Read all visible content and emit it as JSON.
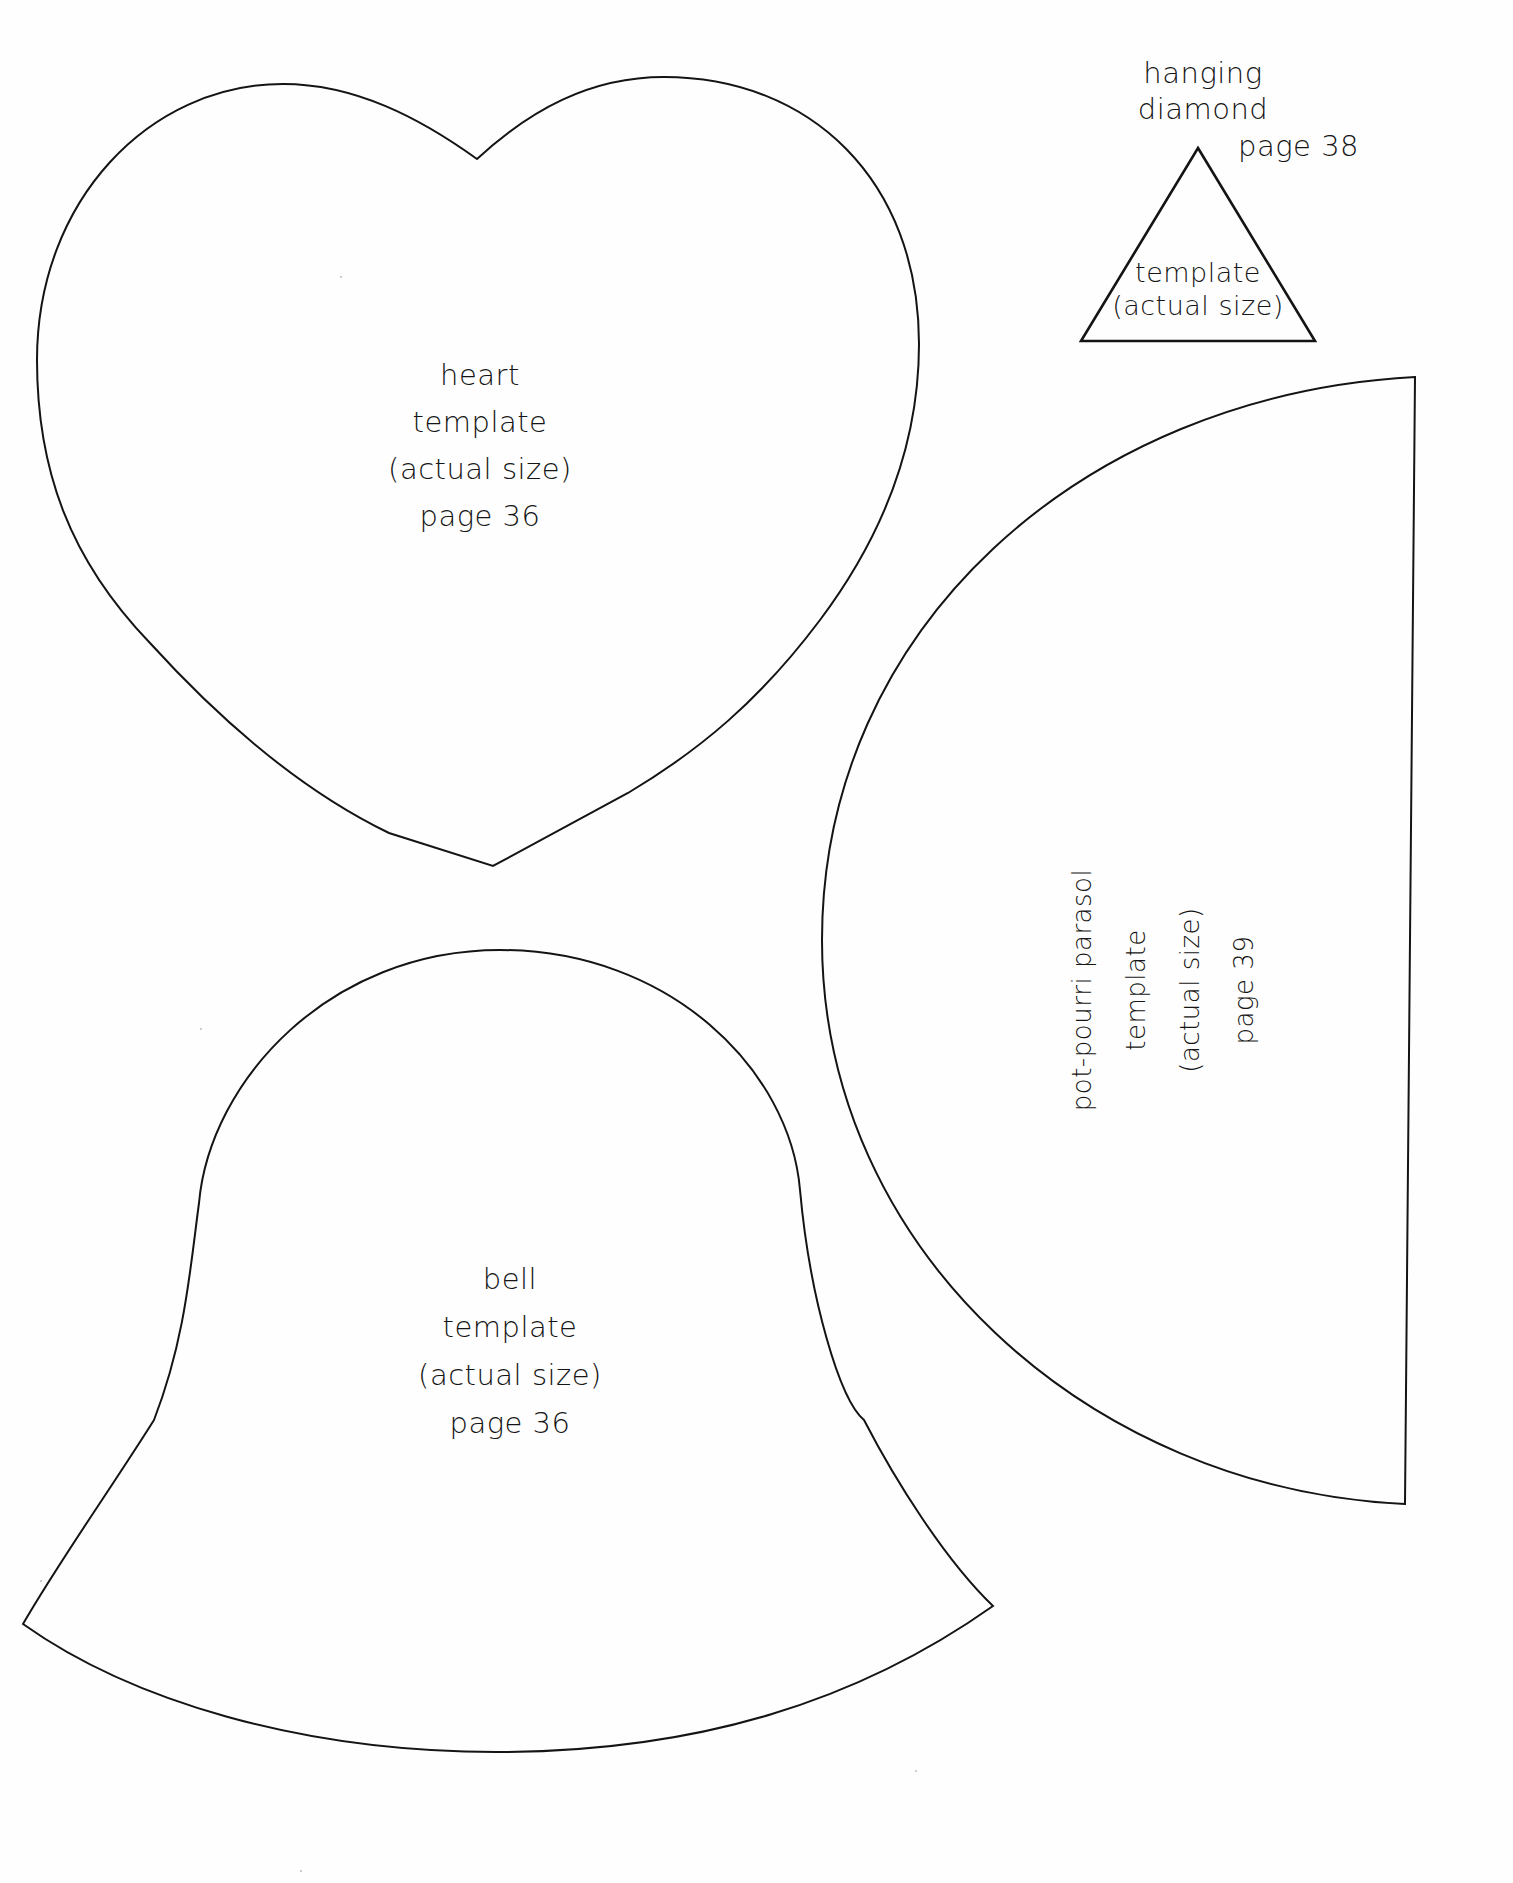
{
  "document": {
    "type": "craft pattern templates sheet",
    "background_color": "#ffffff",
    "ink_color": "#141414"
  },
  "templates": {
    "heart": {
      "lines": [
        "heart",
        "template",
        "(actual size)",
        "page 36"
      ]
    },
    "bell": {
      "lines": [
        "bell",
        "template",
        "(actual size)",
        "page 36"
      ]
    },
    "hanging_diamond": {
      "title_lines": [
        "hanging",
        "diamond"
      ],
      "page": "page 38",
      "inner_lines": [
        "template",
        "(actual size)"
      ]
    },
    "parasol": {
      "lines": [
        "pot-pourri parasol",
        "template",
        "(actual size)",
        "page 39"
      ],
      "orientation": "rotated -90deg"
    }
  }
}
